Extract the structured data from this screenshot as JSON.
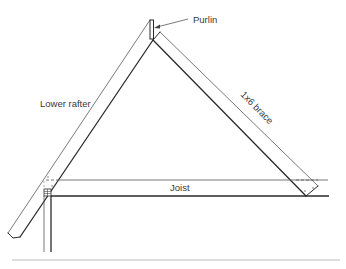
{
  "diagram": {
    "type": "roof framing detail",
    "labels": {
      "purlin": "Purlin",
      "lower_rafter": "Lower rafter",
      "brace": "1x6 brace",
      "joist": "Joist"
    },
    "components": [
      {
        "name": "Lower rafter",
        "description": "sloped member rising from lower left to the purlin at the apex"
      },
      {
        "name": "Purlin",
        "description": "small vertical member at the top of the lower rafter"
      },
      {
        "name": "1x6 brace",
        "description": "diagonal brace from below the purlin down to the right end of the joist"
      },
      {
        "name": "Joist",
        "description": "horizontal member spanning the bottom of the triangle"
      }
    ],
    "colors": {
      "line": "#2a2a2a",
      "light_line": "#6a6a6a",
      "text": "#3a3a3a",
      "divider": "#bdbdbd"
    }
  }
}
